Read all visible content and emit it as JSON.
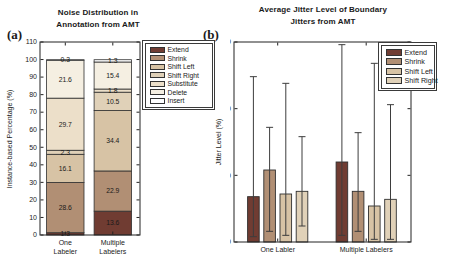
{
  "figure": {
    "panel_a_tag": "(a)",
    "panel_b_tag": "(b)"
  },
  "chart_data": [
    {
      "id": "a",
      "type": "bar",
      "variant": "stacked",
      "title_lines": [
        "Noise Distribution in",
        "Annotation from AMT"
      ],
      "ylabel": "Instance-based Percentage (%)",
      "categories": [
        [
          "One",
          "Labeler"
        ],
        [
          "Multiple",
          "Labelers"
        ]
      ],
      "ylim": [
        0,
        110
      ],
      "yticks": [
        0,
        10,
        20,
        30,
        40,
        50,
        60,
        70,
        80,
        90,
        100,
        110
      ],
      "grid": false,
      "legend_position": "outside-right",
      "series": [
        {
          "name": "Extend",
          "color": "#703c32",
          "values": [
            1.3,
            13.6
          ]
        },
        {
          "name": "Shrink",
          "color": "#b18f74",
          "values": [
            28.6,
            22.9
          ]
        },
        {
          "name": "Shift Left",
          "color": "#d7c3a5",
          "values": [
            16.1,
            34.4
          ]
        },
        {
          "name": "Shift Right",
          "color": "#e0d1b8",
          "values": [
            2.3,
            10.5
          ]
        },
        {
          "name": "Substitute",
          "color": "#ecdfc9",
          "values": [
            29.7,
            1.8
          ]
        },
        {
          "name": "Delete",
          "color": "#f5efe2",
          "values": [
            21.6,
            15.4
          ]
        },
        {
          "name": "Insert",
          "color": "#ffffff",
          "values": [
            0.3,
            1.3
          ]
        }
      ]
    },
    {
      "id": "b",
      "type": "bar",
      "variant": "grouped-with-errorbars",
      "title_lines": [
        "Average Jitter Level of Boundary",
        "Jitters from AMT"
      ],
      "ylabel": "Jitter Level (%)",
      "categories": [
        "One Labler",
        "Multiple Labelers"
      ],
      "ylim": [
        0,
        150
      ],
      "yticks": [
        0,
        50,
        100,
        150
      ],
      "grid": false,
      "legend_position": "inside-top-right",
      "series": [
        {
          "name": "Extend",
          "color": "#703c32",
          "values": [
            34,
            60
          ],
          "err_low": [
            4,
            5
          ],
          "err_high": [
            124,
            148
          ]
        },
        {
          "name": "Shrink",
          "color": "#b18f74",
          "values": [
            54,
            38
          ],
          "err_low": [
            8,
            8
          ],
          "err_high": [
            86,
            82
          ]
        },
        {
          "name": "Shift Left",
          "color": "#d7c3a5",
          "values": [
            36,
            27
          ],
          "err_low": [
            5,
            2
          ],
          "err_high": [
            119,
            134
          ]
        },
        {
          "name": "Shift Right",
          "color": "#e0d1b8",
          "values": [
            38,
            32
          ],
          "err_low": [
            12,
            2
          ],
          "err_high": [
            79,
            103
          ]
        }
      ]
    }
  ]
}
